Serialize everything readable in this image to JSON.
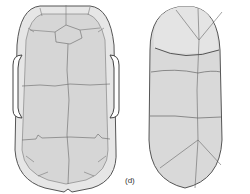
{
  "figure": {
    "panel_label": "(d)",
    "left_diagram": "carapace-with-bony-plates",
    "right_diagram": "plastron-scutes"
  },
  "colors": {
    "fill": "#d9d9d9",
    "fill_light": "#e8e8e8",
    "outline": "#555555",
    "suture": "#6a6a6a",
    "background": "#ffffff"
  }
}
